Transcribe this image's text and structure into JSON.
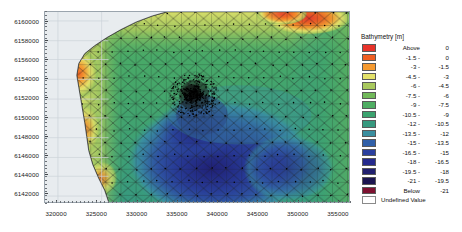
{
  "chart_data": {
    "type": "heatmap",
    "title": "Bathymetry [m]",
    "xlabel": "",
    "ylabel": "",
    "xlim": [
      318500,
      356500
    ],
    "ylim": [
      6141000,
      6161000
    ],
    "grid": true,
    "legend_position": "right",
    "x_ticks": [
      "320000",
      "325000",
      "330000",
      "335000",
      "340000",
      "345000",
      "350000",
      "355000"
    ],
    "x_tick_values": [
      320000,
      325000,
      330000,
      335000,
      340000,
      345000,
      350000,
      355000
    ],
    "y_ticks": [
      "6160000",
      "6158000",
      "6156000",
      "6154000",
      "6152000",
      "6150000",
      "6148000",
      "6146000",
      "6144000",
      "6142000"
    ],
    "y_tick_values": [
      6160000,
      6158000,
      6156000,
      6154000,
      6152000,
      6150000,
      6148000,
      6146000,
      6144000,
      6142000
    ],
    "legend_entries": [
      {
        "label_low": "Above",
        "label_high": "0",
        "color": "#e8332a"
      },
      {
        "label_low": "-1.5 -",
        "label_high": "0",
        "color": "#ef5e22"
      },
      {
        "label_low": "-3 -",
        "label_high": "-1.5",
        "color": "#f59a30"
      },
      {
        "label_low": "-4.5 -",
        "label_high": "-3",
        "color": "#e4e26a"
      },
      {
        "label_low": "-6 -",
        "label_high": "-4.5",
        "color": "#a9c95e"
      },
      {
        "label_low": "-7.5 -",
        "label_high": "-6",
        "color": "#71b95a"
      },
      {
        "label_low": "-9 -",
        "label_high": "-7.5",
        "color": "#4fae63"
      },
      {
        "label_low": "-10.5 -",
        "label_high": "-9",
        "color": "#3ba36f"
      },
      {
        "label_low": "-12 -",
        "label_high": "-10.5",
        "color": "#36997f"
      },
      {
        "label_low": "-13.5 -",
        "label_high": "-12",
        "color": "#3a8fa0"
      },
      {
        "label_low": "-15 -",
        "label_high": "-13.5",
        "color": "#3160a8"
      },
      {
        "label_low": "-16.5 -",
        "label_high": "-15",
        "color": "#2a3f9e"
      },
      {
        "label_low": "-18 -",
        "label_high": "-16.5",
        "color": "#252a8c"
      },
      {
        "label_low": "-19.5 -",
        "label_high": "-18",
        "color": "#21206f"
      },
      {
        "label_low": "-21 -",
        "label_high": "-19.5",
        "color": "#1b1550"
      },
      {
        "label_low": "Below",
        "label_high": "-21",
        "color": "#7d1130"
      },
      {
        "label_low": "Undefined Value",
        "label_high": "",
        "color": "#ffffff"
      }
    ],
    "colors": {
      "plot_background": "#e8ecef",
      "gridline": "#ccd4da",
      "frame": "#9aa4ad",
      "mesh_edge": "#1c1c1c",
      "mesh_node": "#000000"
    }
  },
  "legend": {
    "title": "Bathymetry [m]",
    "undefined_label": "Undefined Value"
  }
}
